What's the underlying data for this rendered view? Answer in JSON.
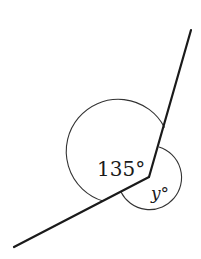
{
  "diagram": {
    "type": "angle-diagram",
    "vertex": [
      149,
      177
    ],
    "rays": [
      {
        "name": "upper-ray",
        "end": [
          191,
          30
        ]
      },
      {
        "name": "lower-left-ray",
        "end": [
          14,
          247
        ]
      }
    ],
    "angles": [
      {
        "name": "angle-135",
        "label": "135°",
        "side": "left"
      },
      {
        "name": "angle-y",
        "label": "y°",
        "side": "right"
      }
    ],
    "colors": {
      "line": "#1a1a1a",
      "arc": "#333333",
      "background": "#ffffff"
    }
  }
}
